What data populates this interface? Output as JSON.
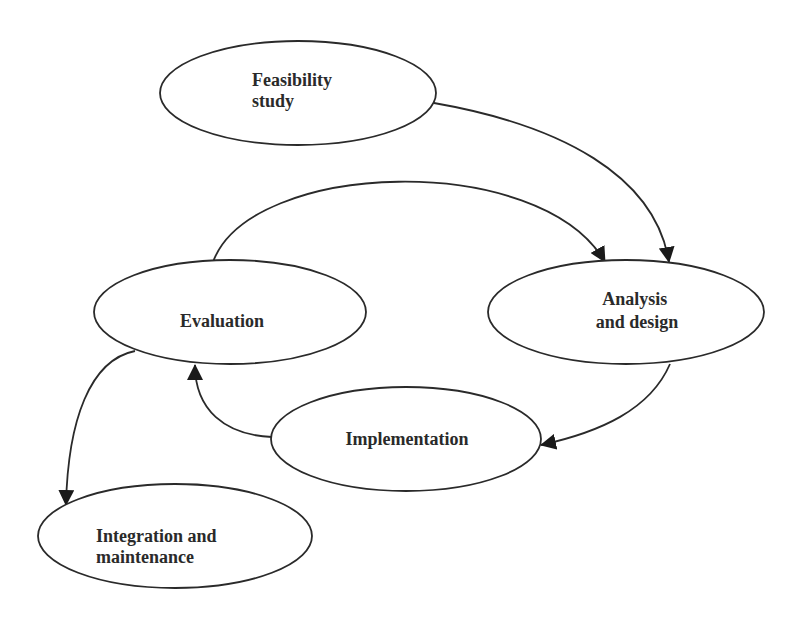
{
  "diagram": {
    "type": "cycle-flow",
    "colors": {
      "stroke": "#2a2a2a",
      "fill": "#ffffff",
      "text": "#2a2a2a",
      "background": "#ffffff"
    },
    "nodes": [
      {
        "id": "feasibility",
        "lines": [
          "Feasibility",
          "study"
        ]
      },
      {
        "id": "analysis",
        "lines": [
          "Analysis",
          "and design"
        ]
      },
      {
        "id": "evaluation",
        "lines": [
          "Evaluation"
        ]
      },
      {
        "id": "implementation",
        "lines": [
          "Implementation"
        ]
      },
      {
        "id": "integration",
        "lines": [
          "Integration and",
          "maintenance"
        ]
      }
    ],
    "edges": [
      {
        "from": "feasibility",
        "to": "analysis"
      },
      {
        "from": "evaluation",
        "to": "analysis"
      },
      {
        "from": "analysis",
        "to": "implementation"
      },
      {
        "from": "implementation",
        "to": "evaluation"
      },
      {
        "from": "evaluation",
        "to": "integration"
      }
    ]
  }
}
